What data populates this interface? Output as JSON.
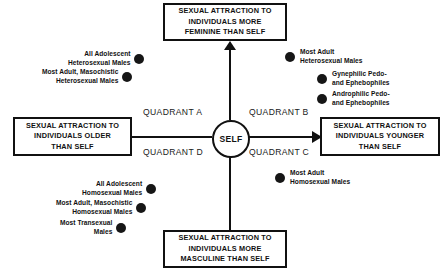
{
  "diagram": {
    "center_node": {
      "label": "SELF"
    },
    "axes": {
      "vertical_top": {
        "label": "SEXUAL ATTRACTION TO INDIVIDUALS MORE FEMININE THAN SELF"
      },
      "vertical_bottom": {
        "label": "SEXUAL ATTRACTION TO INDIVIDUALS MORE MASCULINE THAN SELF"
      },
      "horizontal_left": {
        "label": "SEXUAL ATTRACTION TO INDIVIDUALS OLDER THAN SELF"
      },
      "horizontal_right": {
        "label": "SEXUAL ATTRACTION TO INDIVIDUALS YOUNGER THAN SELF"
      }
    },
    "quadrant_labels": {
      "a": "QUADRANT A",
      "b": "QUADRANT B",
      "c": "QUADRANT C",
      "d": "QUADRANT D"
    },
    "points": {
      "quadrant_a": [
        {
          "label": "All Adolescent Heterosexual Males"
        },
        {
          "label": "Most Adult, Masochistic Heterosexual Males"
        }
      ],
      "quadrant_b": [
        {
          "label": "Most Adult Heterosexual Males"
        },
        {
          "label": "Gynephilic Pedo- and Ephebophiles"
        },
        {
          "label": "Androphilic Pedo- and Ephebophiles"
        }
      ],
      "quadrant_c": [
        {
          "label": "Most Adult Homosexual Males"
        }
      ],
      "quadrant_d": [
        {
          "label": "All Adolescent Homosexual Males"
        },
        {
          "label": "Most Adult, Masochistic Homosexual Males"
        },
        {
          "label": "Most Transexual Males"
        }
      ]
    },
    "caption_stub": "",
    "colors": {
      "line": "#111111",
      "dot": "#161616",
      "background": "#ffffff"
    }
  }
}
